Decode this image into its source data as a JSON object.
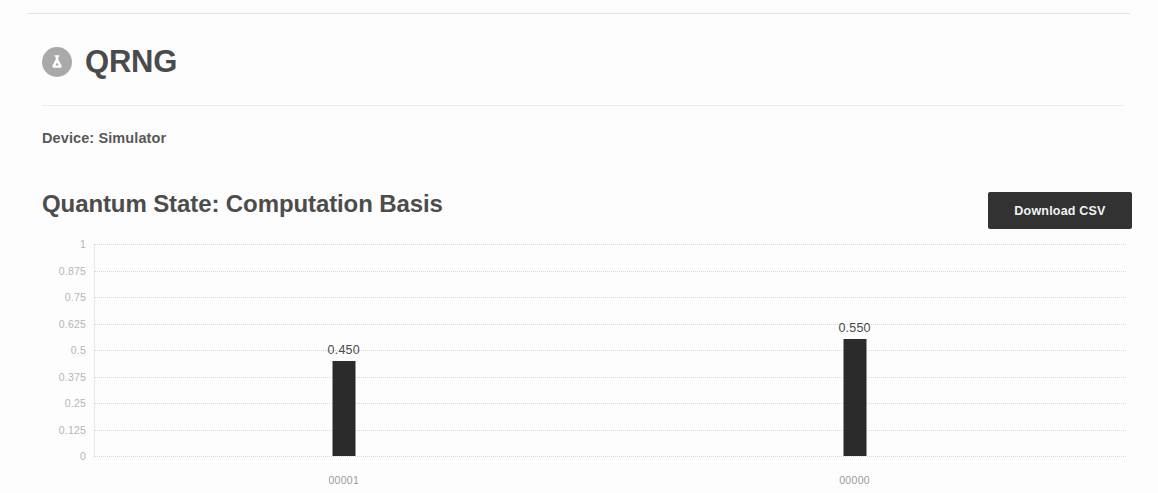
{
  "app": {
    "title": "QRNG",
    "logo_icon": "flask-atom-icon"
  },
  "device": {
    "label": "Device: Simulator"
  },
  "section": {
    "title": "Quantum State: Computation Basis",
    "download_label": "Download CSV"
  },
  "colors": {
    "bar": "#2b2b2b",
    "button_bg": "#323232",
    "button_text": "#f2f2f2",
    "gridline": "#d8d8d8",
    "heading": "#4c4c4c"
  },
  "chart_data": {
    "type": "bar",
    "title": "Quantum State: Computation Basis",
    "xlabel": "",
    "ylabel": "",
    "categories": [
      "00001",
      "00000"
    ],
    "values": [
      0.45,
      0.55
    ],
    "data_labels": [
      "0.450",
      "0.550"
    ],
    "ylim": [
      0,
      1
    ],
    "ytick_values": [
      1,
      0.875,
      0.75,
      0.625,
      0.5,
      0.375,
      0.25,
      0.125,
      0
    ],
    "ytick_labels": [
      "1",
      "0.875",
      "0.75",
      "0.625",
      "0.5",
      "0.375",
      "0.25",
      "0.125",
      "0"
    ],
    "grid": true,
    "grid_style": "dotted-horizontal",
    "legend": false,
    "bar_positions_pct": [
      24.2,
      73.7
    ]
  }
}
